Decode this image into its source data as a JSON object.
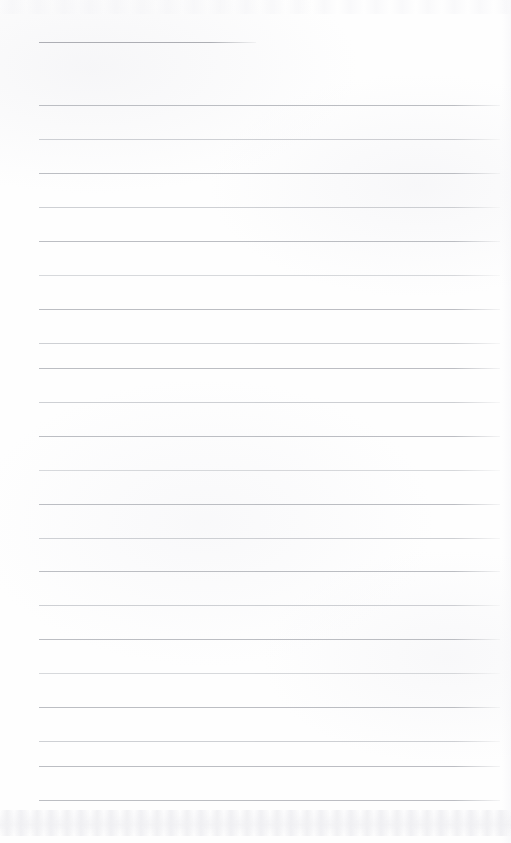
{
  "document": {
    "kind": "scanned-lined-paper",
    "orientation": "portrait",
    "width_px": 511,
    "height_px": 843,
    "page_background_color": "#fefefe",
    "written_text": "",
    "text_content_present": false,
    "note": "Blank ruled writing sheet — no handwriting, headings, or printed words are visible"
  },
  "ruling": {
    "line_color": "#b3b5bb",
    "line_thickness_px": 1,
    "line_spacing_px": 34.3,
    "left_margin_px": 39,
    "right_margin_px": 11,
    "line_count": 22,
    "lines": [
      {
        "index": 1,
        "y": 42,
        "x": 39,
        "width": 217,
        "weight": "title-rule",
        "role": "heading-rule"
      },
      {
        "index": 2,
        "y": 105,
        "x": 39,
        "width": 461,
        "weight": "normal",
        "role": "body-rule"
      },
      {
        "index": 3,
        "y": 139,
        "x": 39,
        "width": 461,
        "weight": "faint",
        "role": "body-rule"
      },
      {
        "index": 4,
        "y": 173,
        "x": 39,
        "width": 461,
        "weight": "normal",
        "role": "body-rule"
      },
      {
        "index": 5,
        "y": 207,
        "x": 39,
        "width": 461,
        "weight": "faint",
        "role": "body-rule"
      },
      {
        "index": 6,
        "y": 241,
        "x": 39,
        "width": 461,
        "weight": "normal",
        "role": "body-rule"
      },
      {
        "index": 7,
        "y": 275,
        "x": 39,
        "width": 461,
        "weight": "fainter",
        "role": "body-rule"
      },
      {
        "index": 8,
        "y": 309,
        "x": 39,
        "width": 461,
        "weight": "normal",
        "role": "body-rule"
      },
      {
        "index": 9,
        "y": 343,
        "x": 39,
        "width": 461,
        "weight": "faint",
        "role": "body-rule"
      },
      {
        "index": 10,
        "y": 368,
        "x": 39,
        "width": 461,
        "weight": "normal",
        "role": "body-rule"
      },
      {
        "index": 11,
        "y": 402,
        "x": 39,
        "width": 461,
        "weight": "faint",
        "role": "body-rule"
      },
      {
        "index": 12,
        "y": 436,
        "x": 39,
        "width": 461,
        "weight": "normal",
        "role": "body-rule"
      },
      {
        "index": 13,
        "y": 470,
        "x": 39,
        "width": 461,
        "weight": "fainter",
        "role": "body-rule"
      },
      {
        "index": 14,
        "y": 504,
        "x": 39,
        "width": 461,
        "weight": "normal",
        "role": "body-rule"
      },
      {
        "index": 15,
        "y": 538,
        "x": 39,
        "width": 461,
        "weight": "faint",
        "role": "body-rule"
      },
      {
        "index": 16,
        "y": 571,
        "x": 39,
        "width": 461,
        "weight": "normal",
        "role": "body-rule"
      },
      {
        "index": 17,
        "y": 605,
        "x": 39,
        "width": 461,
        "weight": "faint",
        "role": "body-rule"
      },
      {
        "index": 18,
        "y": 639,
        "x": 39,
        "width": 461,
        "weight": "normal",
        "role": "body-rule"
      },
      {
        "index": 19,
        "y": 673,
        "x": 39,
        "width": 461,
        "weight": "fainter",
        "role": "body-rule"
      },
      {
        "index": 20,
        "y": 707,
        "x": 39,
        "width": 461,
        "weight": "normal",
        "role": "body-rule"
      },
      {
        "index": 21,
        "y": 741,
        "x": 39,
        "width": 461,
        "weight": "faint",
        "role": "body-rule"
      },
      {
        "index": 22,
        "y": 766,
        "x": 39,
        "width": 461,
        "weight": "normal",
        "role": "body-rule"
      },
      {
        "index": 23,
        "y": 800,
        "x": 39,
        "width": 461,
        "weight": "normal",
        "role": "body-rule"
      }
    ]
  },
  "artifacts": {
    "bottom_noise": {
      "y": 810,
      "height": 26,
      "description": "faint scanner smudge band along bottom edge"
    },
    "top_noise": {
      "y": 0,
      "height": 14,
      "description": "faint scanner band along top edge"
    },
    "right_edge_shading": {
      "description": "very light vertical scan falloff at right edge"
    }
  }
}
